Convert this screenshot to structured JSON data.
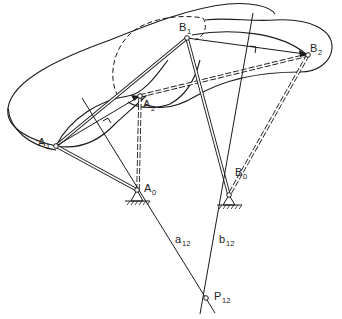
{
  "diagram": {
    "labels": {
      "A1": {
        "main": "A",
        "sub": "1"
      },
      "A2": {
        "main": "A",
        "sub": "2"
      },
      "A0": {
        "main": "A",
        "sub": "0"
      },
      "B1": {
        "main": "B",
        "sub": "1"
      },
      "B2": {
        "main": "B",
        "sub": "2"
      },
      "B0": {
        "main": "B",
        "sub": "0"
      },
      "P12": {
        "main": "P",
        "sub": "12"
      },
      "a12": {
        "main": "a",
        "sub": "12"
      },
      "b12": {
        "main": "b",
        "sub": "12"
      }
    },
    "points": {
      "A1": [
        56,
        146
      ],
      "A2": [
        140,
        96
      ],
      "A0": [
        137,
        190
      ],
      "B1": [
        187,
        38
      ],
      "B2": [
        308,
        55
      ],
      "B0": [
        229,
        195
      ],
      "P12": [
        206,
        298
      ]
    },
    "elements": [
      "coupler body position 1 (solid outline)",
      "coupler body position 2 (solid outline)",
      "dashed coupler outline lobe",
      "link A0-A1 (double line)",
      "link A0-A2 (dashed double line)",
      "link B0-B1 (double line)",
      "link B0-B2 (dashed double line)",
      "coupler A1-B1 (double line)",
      "coupler A2-B2 (dashed double line)",
      "mid-normal a12 through A0",
      "mid-normal b12 through B0",
      "pole P12 at intersection",
      "ground supports at A0 and B0"
    ]
  }
}
